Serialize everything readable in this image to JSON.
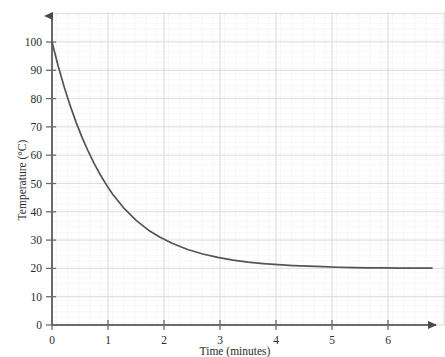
{
  "chart_data": {
    "type": "line",
    "title": "",
    "subtitle": "",
    "xlabel": "Time (minutes)",
    "ylabel": "Temperature (°C)",
    "xlim": [
      0,
      6.5
    ],
    "ylim": [
      0,
      108
    ],
    "xticks": [
      "0",
      "1",
      "2",
      "3",
      "4",
      "5",
      "6"
    ],
    "xtick_values": [
      0,
      1,
      2,
      3,
      4,
      5,
      6
    ],
    "yticks": [
      "0",
      "10",
      "20",
      "30",
      "40",
      "50",
      "60",
      "70",
      "80",
      "90",
      "100"
    ],
    "ytick_values": [
      0,
      10,
      20,
      30,
      40,
      50,
      60,
      70,
      80,
      90,
      100
    ],
    "grid": true,
    "grid_major_step_x": 1,
    "grid_major_step_y": 10,
    "grid_minor_step_x": 0.2,
    "grid_minor_step_y": 2,
    "legend": "none",
    "axis_arrows": true,
    "series": [
      {
        "name": "Temperature",
        "model": "exponential decay",
        "asymptote": 20,
        "initial_value": 100,
        "x": [
          0,
          0.1,
          0.2,
          0.3,
          0.4,
          0.5,
          0.6,
          0.7,
          0.8,
          0.9,
          1,
          1.2,
          1.4,
          1.6,
          1.8,
          2,
          2.25,
          2.5,
          2.75,
          3,
          3.25,
          3.5,
          3.75,
          4,
          4.25,
          4.5,
          4.75,
          5,
          5.25,
          5.5,
          5.75,
          6,
          6.3
        ],
        "values": [
          100,
          91.7,
          84.3,
          77.6,
          71.6,
          66.2,
          61.4,
          57,
          53.1,
          49.6,
          46.4,
          41.1,
          36.9,
          33.5,
          30.9,
          28.8,
          26.7,
          25.1,
          23.9,
          22.9,
          22.2,
          21.7,
          21.3,
          21,
          20.8,
          20.6,
          20.4,
          20.3,
          20.2,
          20.2,
          20.1,
          20.1,
          20.1
        ]
      }
    ]
  },
  "colors": {
    "curve": "#555555",
    "axis": "#6b6b6b",
    "grid_major": "#d8d8de",
    "grid_minor": "#eeeef2",
    "text": "#2b2b2b",
    "background": "#ffffff"
  }
}
